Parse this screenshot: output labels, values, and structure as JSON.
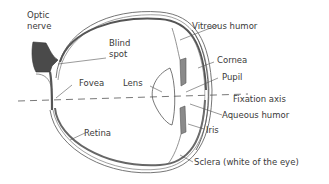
{
  "diagram": {
    "colors": {
      "line": "#555555",
      "fill_dark": "#4a4a4a",
      "fill_gray": "#8a8a8a",
      "background": "#ffffff",
      "text": "#3a3a3a"
    },
    "labels": {
      "optic_nerve_1": "Optic",
      "optic_nerve_2": "nerve",
      "blind_spot_1": "Blind",
      "blind_spot_2": "spot",
      "vitreous_humor": "Vitreous humor",
      "cornea": "Cornea",
      "pupil": "Pupil",
      "fovea": "Fovea",
      "lens": "Lens",
      "fixation_axis": "Fixation axis",
      "aqueous_humor": "Aqueous humor",
      "iris": "Iris",
      "retina": "Retina",
      "sclera": "Sclera (white of the eye)"
    }
  }
}
